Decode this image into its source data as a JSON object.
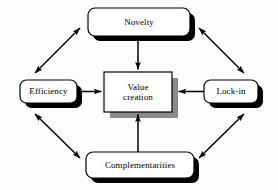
{
  "diagram": {
    "type": "value-creation-sources-model",
    "title": "",
    "center_node": {
      "id": "value-creation",
      "label": "Value\ncreation",
      "shape": "rectangle",
      "shadow_color": "#8a8a8a",
      "fill": "#ffffff",
      "border_color": "#000000"
    },
    "outer_nodes": [
      {
        "id": "novelty",
        "label": "Novelty",
        "position": "top",
        "shape": "rounded-rectangle",
        "shadow_color": "#000000",
        "fill": "#ffffff",
        "border_color": "#000000"
      },
      {
        "id": "efficiency",
        "label": "Efficiency",
        "position": "left",
        "shape": "rounded-rectangle",
        "shadow_color": "#000000",
        "fill": "#ffffff",
        "border_color": "#000000"
      },
      {
        "id": "lock-in",
        "label": "Lock-in",
        "position": "right",
        "shape": "rounded-rectangle",
        "shadow_color": "#000000",
        "fill": "#ffffff",
        "border_color": "#000000"
      },
      {
        "id": "complementarities",
        "label": "Complementarities",
        "position": "bottom",
        "shape": "rounded-rectangle",
        "shadow_color": "#000000",
        "fill": "#ffffff",
        "border_color": "#000000"
      }
    ],
    "connectors": [
      {
        "id": "novelty-to-center",
        "from": "novelty",
        "to": "value-creation",
        "heads": "single",
        "direction": "down",
        "style": "solid"
      },
      {
        "id": "efficiency-to-center",
        "from": "efficiency",
        "to": "value-creation",
        "heads": "single",
        "direction": "right",
        "style": "solid"
      },
      {
        "id": "lock-in-to-center",
        "from": "lock-in",
        "to": "value-creation",
        "heads": "single",
        "direction": "left",
        "style": "solid"
      },
      {
        "id": "complementarities-to-center",
        "from": "complementarities",
        "to": "value-creation",
        "heads": "single",
        "direction": "up",
        "style": "solid"
      },
      {
        "id": "efficiency-novelty",
        "from": "efficiency",
        "to": "novelty",
        "heads": "double",
        "direction": "diagonal-up-right",
        "style": "solid"
      },
      {
        "id": "novelty-lock-in",
        "from": "novelty",
        "to": "lock-in",
        "heads": "double",
        "direction": "diagonal-down-right",
        "style": "solid"
      },
      {
        "id": "efficiency-complementarities",
        "from": "efficiency",
        "to": "complementarities",
        "heads": "double",
        "direction": "diagonal-down-right",
        "style": "solid"
      },
      {
        "id": "complementarities-lock-in",
        "from": "complementarities",
        "to": "lock-in",
        "heads": "double",
        "direction": "diagonal-up-right",
        "style": "solid"
      }
    ],
    "colors": {
      "background": "#fdfdfb",
      "line": "#000000",
      "node_fill": "#ffffff",
      "node_border": "#000000",
      "hard_shadow": "#000000",
      "soft_shadow": "#8a8a8a"
    }
  }
}
